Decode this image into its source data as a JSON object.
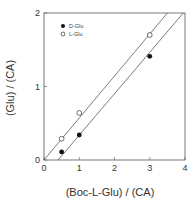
{
  "chart_data": {
    "type": "scatter",
    "title": "",
    "xlabel": "(Boc-L-Glu) / (CA)",
    "ylabel": "(Glu) / (CA)",
    "xlim": [
      0,
      4
    ],
    "ylim": [
      0,
      2
    ],
    "x_ticks": [
      "0",
      "1",
      "2",
      "3",
      "4"
    ],
    "y_ticks": [
      "0",
      "1",
      "2"
    ],
    "grid": false,
    "legend_position": "upper-left",
    "series": [
      {
        "name": "D-Glu",
        "marker": "filled-circle",
        "points": [
          [
            0.5,
            0.11
          ],
          [
            1.0,
            0.34
          ],
          [
            3.0,
            1.41
          ]
        ],
        "fit_line": [
          [
            0.4,
            0.0
          ],
          [
            3.95,
            2.0
          ]
        ]
      },
      {
        "name": "L-Glu",
        "marker": "open-circle",
        "points": [
          [
            0.5,
            0.29
          ],
          [
            1.0,
            0.64
          ],
          [
            3.0,
            1.7
          ]
        ],
        "fit_line": [
          [
            0.0,
            0.0
          ],
          [
            3.5,
            2.0
          ]
        ]
      }
    ],
    "colors": {
      "axis": "#555555",
      "line": "#444444",
      "marker": "#111111"
    }
  }
}
